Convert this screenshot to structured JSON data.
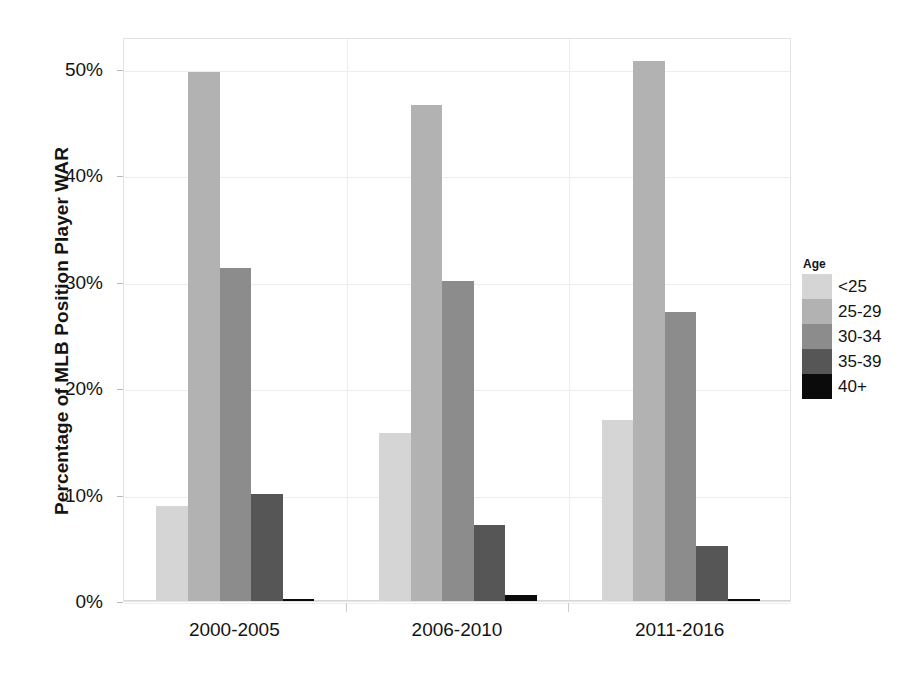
{
  "chart_data": {
    "type": "bar",
    "title": "",
    "xlabel": "",
    "ylabel": "Percentage of MLB Position Player WAR",
    "categories": [
      "2000-2005",
      "2006-2010",
      "2011-2016"
    ],
    "ylim": [
      0,
      53
    ],
    "ytick_values": [
      0,
      10,
      20,
      30,
      40,
      50
    ],
    "ytick_labels": [
      "0%",
      "10%",
      "20%",
      "30%",
      "40%",
      "50%"
    ],
    "grid": true,
    "legend_title": "Age",
    "legend_position": "right",
    "series": [
      {
        "name": "<25",
        "color": "#d5d5d5",
        "values": [
          8.9,
          15.8,
          17.0
        ]
      },
      {
        "name": "25-29",
        "color": "#b2b2b2",
        "values": [
          49.7,
          46.6,
          50.7
        ]
      },
      {
        "name": "30-34",
        "color": "#8c8c8c",
        "values": [
          31.3,
          30.1,
          27.2
        ]
      },
      {
        "name": "35-39",
        "color": "#565656",
        "values": [
          10.1,
          7.1,
          5.2
        ]
      },
      {
        "name": "40+",
        "color": "#0b0b0b",
        "values": [
          0.2,
          0.6,
          0.2
        ]
      }
    ]
  },
  "axis": {
    "y_title": "Percentage of MLB Position Player WAR"
  },
  "legend": {
    "title": "Age",
    "items": [
      {
        "label": "<25",
        "color": "#d5d5d5"
      },
      {
        "label": "25-29",
        "color": "#b2b2b2"
      },
      {
        "label": "30-34",
        "color": "#8c8c8c"
      },
      {
        "label": "35-39",
        "color": "#565656"
      },
      {
        "label": "40+",
        "color": "#0b0b0b"
      }
    ]
  }
}
